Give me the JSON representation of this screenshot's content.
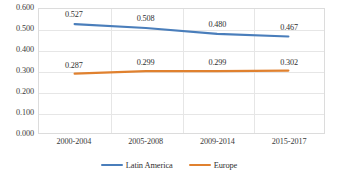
{
  "chart_data": {
    "type": "line",
    "title": "",
    "xlabel": "",
    "ylabel": "",
    "categories": [
      "2000-2004",
      "2005-2008",
      "2009-2014",
      "2015-2017"
    ],
    "series": [
      {
        "name": "Latin America",
        "color": "#4A7EBB",
        "values": [
          0.527,
          0.508,
          0.48,
          0.467
        ],
        "labels": [
          "0.527",
          "0.508",
          "0.480",
          "0.467"
        ]
      },
      {
        "name": "Europe",
        "color": "#E0812F",
        "values": [
          0.287,
          0.299,
          0.299,
          0.302
        ],
        "labels": [
          "0.287",
          "0.299",
          "0.299",
          "0.302"
        ]
      }
    ],
    "ylim": [
      0.0,
      0.6
    ],
    "ytick_step": 0.1,
    "ytick_labels": [
      "0.600",
      "0.500",
      "0.400",
      "0.300",
      "0.200",
      "0.100",
      "0.000"
    ],
    "ytick_values": [
      0.6,
      0.5,
      0.4,
      0.3,
      0.2,
      0.1,
      0.0
    ],
    "grid": {
      "horizontal": true,
      "vertical": true,
      "color": "#e6e6e6"
    },
    "legend": {
      "position": "bottom",
      "entries": [
        "Latin America",
        "Europe"
      ]
    },
    "plot_border_color": "#dcdcdc",
    "background": "#ffffff"
  }
}
